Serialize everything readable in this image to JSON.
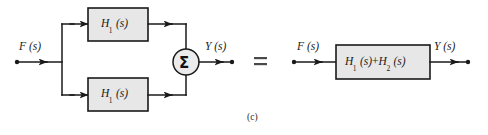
{
  "figure": {
    "caption": "(c)",
    "equals_symbol": "=",
    "colors": {
      "block_fill": "#e7e7e7",
      "stroke": "#1a1a1a",
      "background": "#ffffff"
    }
  },
  "left_diagram": {
    "input_label": "F (s)",
    "output_label": "Y (s)",
    "summing_junction_symbol": "Σ",
    "blocks": [
      {
        "label_main": "H",
        "label_sub": "1",
        "label_arg": "(s)",
        "full": "H1 (s)"
      },
      {
        "label_main": "H",
        "label_sub": "1",
        "label_arg": "(s)",
        "full": "H1 (s)"
      }
    ]
  },
  "right_diagram": {
    "input_label": "F (s)",
    "output_label": "Y (s)",
    "block": {
      "term1_main": "H",
      "term1_sub": "1",
      "term1_arg": "(s)",
      "operator": "+",
      "term2_main": "H",
      "term2_sub": "2",
      "term2_arg": "(s)",
      "full": "H1 (s)+H2 (s)"
    }
  }
}
